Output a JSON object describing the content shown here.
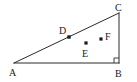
{
  "figure": {
    "type": "geometry-diagram",
    "shape": "right-triangle",
    "width": 137,
    "height": 82,
    "background_color": "#ffffff",
    "stroke_color": "#2b2b2b",
    "label_color": "#1a1a1a",
    "dot_color": "#1a1a1a"
  },
  "vertices": {
    "a": {
      "label": "A",
      "x": 14,
      "y": 63,
      "label_x": 9,
      "label_y": 74
    },
    "b": {
      "label": "B",
      "x": 119,
      "y": 63,
      "label_x": 116,
      "label_y": 75
    },
    "c": {
      "label": "C",
      "x": 119,
      "y": 13,
      "label_x": 116,
      "label_y": 10
    }
  },
  "points": {
    "d": {
      "label": "D",
      "x": 69,
      "y": 37,
      "label_x": 61,
      "label_y": 33
    },
    "e": {
      "label": "E",
      "x": 86,
      "y": 43,
      "label_x": 83,
      "label_y": 56
    },
    "f": {
      "label": "F",
      "x": 101,
      "y": 39,
      "label_x": 106,
      "label_y": 38
    }
  },
  "edges": [
    {
      "name": "edge-ab",
      "from": "A",
      "to": "B"
    },
    {
      "name": "edge-bc",
      "from": "B",
      "to": "C"
    },
    {
      "name": "edge-ca",
      "from": "C",
      "to": "A"
    }
  ],
  "markers": {
    "right_angle_at": "B",
    "right_angle_size": 5
  }
}
